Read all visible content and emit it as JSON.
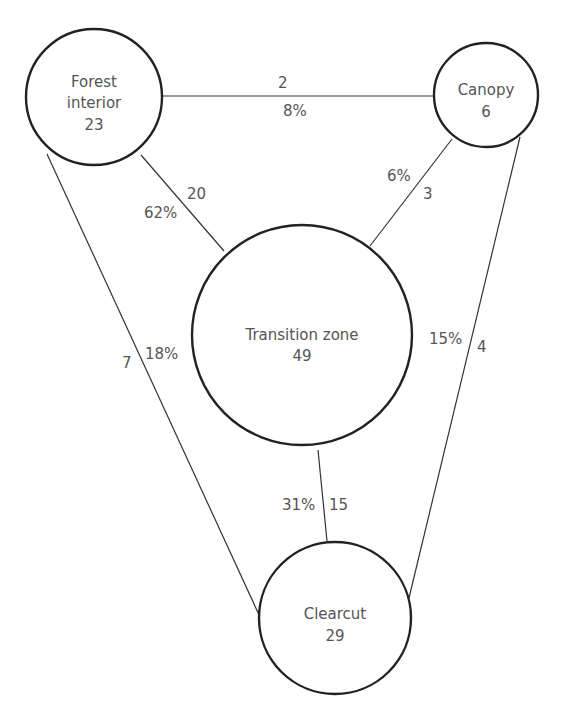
{
  "nodes": {
    "forest_interior": {
      "line1": "Forest",
      "line2": "interior",
      "count": "23"
    },
    "canopy": {
      "line1": "Canopy",
      "count": "6"
    },
    "transition_zone": {
      "line1": "Transition zone",
      "count": "49"
    },
    "clearcut": {
      "line1": "Clearcut",
      "count": "29"
    }
  },
  "edges": {
    "forest_canopy": {
      "count": "2",
      "percent": "8%"
    },
    "forest_transition": {
      "count": "20",
      "percent": "62%"
    },
    "canopy_transition": {
      "count": "3",
      "percent": "6%"
    },
    "forest_clearcut": {
      "count": "7",
      "percent": "18%"
    },
    "canopy_clearcut": {
      "count": "4",
      "percent": "15%"
    },
    "transition_clearcut": {
      "count": "15",
      "percent": "31%"
    }
  },
  "colors": {
    "stroke": "#222222",
    "text": "#555555",
    "background": "#ffffff"
  }
}
